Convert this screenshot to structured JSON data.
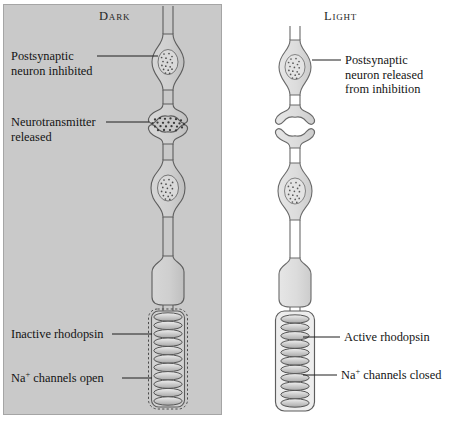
{
  "figure": {
    "type": "biology-diagram",
    "background_color": "#ffffff",
    "panels": [
      {
        "id": "dark",
        "title": "Dark",
        "background_color": "#c9c9c9",
        "border_color": "#9a9a9a",
        "outer_segment_membrane": "dashed",
        "neurotransmitter_visible": true,
        "labels": [
          {
            "id": "postsynaptic",
            "lines": [
              "Postsynaptic",
              "neuron inhibited"
            ]
          },
          {
            "id": "neurotransmitter",
            "lines": [
              "Neurotransmitter",
              "released"
            ]
          },
          {
            "id": "rhodopsin",
            "lines": [
              "Inactive rhodopsin"
            ]
          },
          {
            "id": "channels",
            "lines": [
              "Na",
              "channels open"
            ],
            "superscript": "+"
          }
        ]
      },
      {
        "id": "light",
        "title": "Light",
        "background_color": "#ffffff",
        "border_color": "#ffffff",
        "outer_segment_membrane": "solid",
        "neurotransmitter_visible": false,
        "labels": [
          {
            "id": "postsynaptic",
            "lines": [
              "Postsynaptic",
              "neuron released",
              "from inhibition"
            ]
          },
          {
            "id": "rhodopsin",
            "lines": [
              "Active rhodopsin"
            ]
          },
          {
            "id": "channels",
            "lines": [
              "Na",
              "channels closed"
            ],
            "superscript": "+"
          }
        ]
      }
    ],
    "text": {
      "dark_title": "Dark",
      "light_title": "Light",
      "dark_postsynaptic_l1": "Postsynaptic",
      "dark_postsynaptic_l2": "neuron inhibited",
      "dark_neurotransmitter_l1": "Neurotransmitter",
      "dark_neurotransmitter_l2": "released",
      "dark_rhodopsin": "Inactive rhodopsin",
      "dark_channels_ion": "Na",
      "dark_channels_sup": "+",
      "dark_channels_rest": " channels open",
      "light_postsynaptic_l1": "Postsynaptic",
      "light_postsynaptic_l2": "neuron released",
      "light_postsynaptic_l3": "from inhibition",
      "light_rhodopsin": "Active rhodopsin",
      "light_channels_ion": "Na",
      "light_channels_sup": "+",
      "light_channels_rest": " channels closed"
    }
  }
}
